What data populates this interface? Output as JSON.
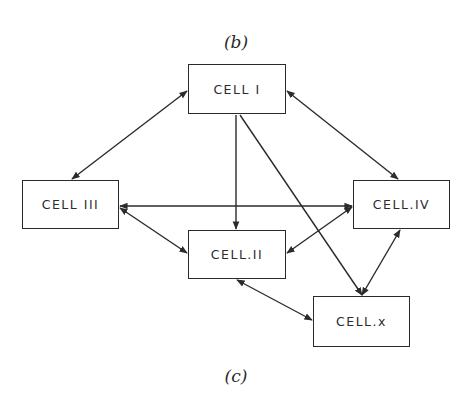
{
  "captions": {
    "top": "(b)",
    "bottom": "(c)"
  },
  "colors": {
    "ink": "#2b2b2b",
    "background": "#ffffff"
  },
  "cells": [
    {
      "id": "cell-1",
      "label": "CELL I",
      "x": 188,
      "y": 64,
      "w": 98,
      "h": 50
    },
    {
      "id": "cell-3",
      "label": "CELL III",
      "x": 22,
      "y": 180,
      "w": 97,
      "h": 49
    },
    {
      "id": "cell-4",
      "label": "CELL.IV",
      "x": 353,
      "y": 180,
      "w": 97,
      "h": 49
    },
    {
      "id": "cell-2",
      "label": "CELL.II",
      "x": 188,
      "y": 230,
      "w": 98,
      "h": 49
    },
    {
      "id": "cell-x",
      "label": "CELL.x",
      "x": 313,
      "y": 296,
      "w": 97,
      "h": 51
    }
  ],
  "connections": [
    {
      "from": "CELL I",
      "to": "CELL III",
      "type": "bidirectional"
    },
    {
      "from": "CELL I",
      "to": "CELL.IV",
      "type": "bidirectional"
    },
    {
      "from": "CELL I",
      "to": "CELL.II",
      "type": "directed"
    },
    {
      "from": "CELL I",
      "to": "CELL.x",
      "type": "directed"
    },
    {
      "from": "CELL III",
      "to": "CELL.IV",
      "type": "bidirectional"
    },
    {
      "from": "CELL III",
      "to": "CELL.II",
      "type": "bidirectional"
    },
    {
      "from": "CELL.II",
      "to": "CELL.IV",
      "type": "bidirectional"
    },
    {
      "from": "CELL.II",
      "to": "CELL.x",
      "type": "bidirectional"
    },
    {
      "from": "CELL.IV",
      "to": "CELL.x",
      "type": "bidirectional"
    }
  ]
}
